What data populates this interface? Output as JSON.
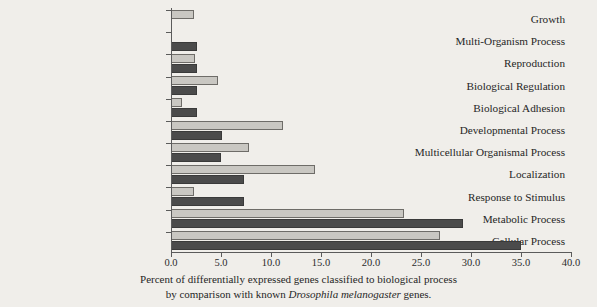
{
  "chart_data": {
    "type": "bar",
    "orientation": "horizontal",
    "title": "",
    "xlabel": "",
    "ylabel": "",
    "xlim": [
      0.0,
      40.0
    ],
    "xticks": [
      "0.0",
      "5.0",
      "10.0",
      "15.0",
      "20.0",
      "25.0",
      "30.0",
      "35.0",
      "40.0"
    ],
    "xtick_values": [
      0,
      5,
      10,
      15,
      20,
      25,
      30,
      35,
      40
    ],
    "grid": false,
    "legend": "none",
    "categories": [
      "Growth",
      "Multi-Organism Process",
      "Reproduction",
      "Biological Regulation",
      "Biological Adhesion",
      "Developmental Process",
      "Multicellular Organismal Process",
      "Localization",
      "Response to Stimulus",
      "Metabolic Process",
      "Cellular Process"
    ],
    "series": [
      {
        "name": "light",
        "color": "#c9c7c2",
        "values": [
          2.3,
          0.0,
          2.4,
          4.7,
          1.1,
          11.2,
          7.8,
          14.4,
          2.3,
          23.3,
          26.9
        ]
      },
      {
        "name": "dark",
        "color": "#4b4b4b",
        "values": [
          0.0,
          2.6,
          2.6,
          2.6,
          2.6,
          5.1,
          5.0,
          7.3,
          7.3,
          29.2,
          35.0
        ]
      }
    ]
  },
  "caption": {
    "line1": "Percent of differentially expressed genes classified to biological process",
    "line2_pre": "by comparison with known ",
    "line2_species": "Drosophila melanogaster",
    "line2_post": " genes."
  }
}
